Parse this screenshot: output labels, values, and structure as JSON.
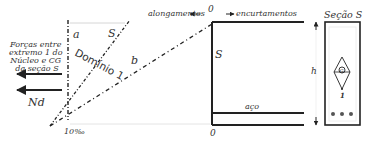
{
  "diagram": {
    "labels": {
      "forces_text": [
        "Forças entre",
        "extremo 1 do",
        "Núcleo e CG",
        "da seção S"
      ],
      "nd": "Nd",
      "a": "a",
      "s_line": "S",
      "b": "b",
      "dominio": "Domínio 1",
      "strain_10": "10‰",
      "alongamentos": "alongamentos",
      "encurtamentos": "encurtamentos",
      "zero_top": "0",
      "zero_bottom": "0",
      "s_beam": "S",
      "aco": "aço",
      "h": "h",
      "secao_title": "Seção S",
      "g": "G",
      "one": "1"
    },
    "colors": {
      "line": "#222222",
      "text": "#333333"
    }
  }
}
